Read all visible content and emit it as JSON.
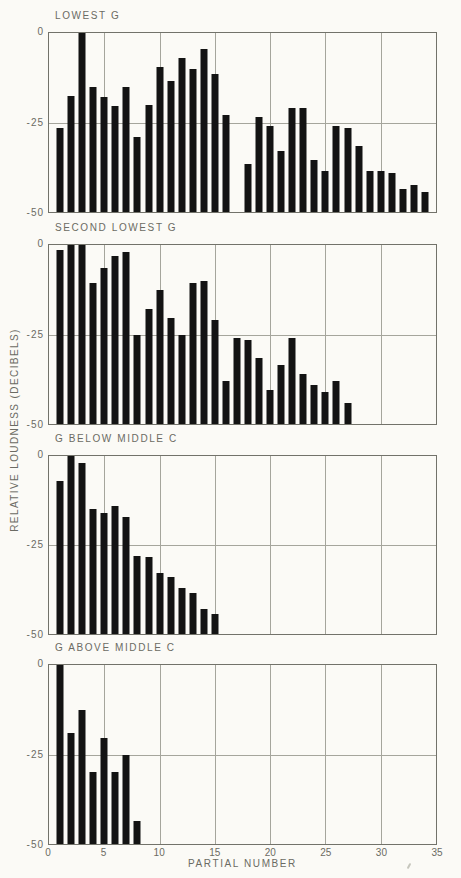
{
  "figure": {
    "x_tick_labels": [
      "0",
      "5",
      "10",
      "15",
      "20",
      "25",
      "30",
      "35"
    ],
    "y_tick_labels": [
      "0",
      "-25",
      "-50"
    ]
  },
  "chart_data": {
    "type": "bar",
    "xlabel": "PARTIAL NUMBER",
    "ylabel": "RELATIVE LOUDNESS (DECIBELS)",
    "xlim": [
      0,
      35
    ],
    "ylim": [
      -50,
      0
    ],
    "x_ticks": [
      0,
      5,
      10,
      15,
      20,
      25,
      30,
      35
    ],
    "y_ticks": [
      0,
      -25,
      -50
    ],
    "grid": "vertical lines every 5 partials; horizontal line at -25",
    "bar_color": "#131313",
    "panels": [
      {
        "title": "LOWEST G",
        "bars": [
          {
            "p": 1,
            "db": -26.5
          },
          {
            "p": 2,
            "db": -17.5
          },
          {
            "p": 3,
            "db": 0
          },
          {
            "p": 4,
            "db": -15
          },
          {
            "p": 5,
            "db": -18
          },
          {
            "p": 6,
            "db": -20.5
          },
          {
            "p": 7,
            "db": -15
          },
          {
            "p": 8,
            "db": -29
          },
          {
            "p": 9,
            "db": -20
          },
          {
            "p": 10,
            "db": -9.5
          },
          {
            "p": 11,
            "db": -13.5
          },
          {
            "p": 12,
            "db": -7
          },
          {
            "p": 13,
            "db": -10
          },
          {
            "p": 14,
            "db": -4.5
          },
          {
            "p": 15,
            "db": -11.5
          },
          {
            "p": 16,
            "db": -23
          },
          {
            "p": 18,
            "db": -36.5
          },
          {
            "p": 19,
            "db": -23.5
          },
          {
            "p": 20,
            "db": -26
          },
          {
            "p": 21,
            "db": -33
          },
          {
            "p": 22,
            "db": -21
          },
          {
            "p": 23,
            "db": -21
          },
          {
            "p": 24,
            "db": -35.5
          },
          {
            "p": 25,
            "db": -38.5
          },
          {
            "p": 26,
            "db": -26
          },
          {
            "p": 27,
            "db": -26.5
          },
          {
            "p": 28,
            "db": -31.5
          },
          {
            "p": 29,
            "db": -38.5
          },
          {
            "p": 30,
            "db": -38.5
          },
          {
            "p": 31,
            "db": -39
          },
          {
            "p": 32,
            "db": -43.5
          },
          {
            "p": 33,
            "db": -42.5
          },
          {
            "p": 34,
            "db": -44.5
          }
        ]
      },
      {
        "title": "SECOND LOWEST G",
        "bars": [
          {
            "p": 1,
            "db": -1.5
          },
          {
            "p": 2,
            "db": 0
          },
          {
            "p": 3,
            "db": 0
          },
          {
            "p": 4,
            "db": -10.5
          },
          {
            "p": 5,
            "db": -6.5
          },
          {
            "p": 6,
            "db": -3
          },
          {
            "p": 7,
            "db": -2
          },
          {
            "p": 8,
            "db": -25
          },
          {
            "p": 9,
            "db": -18
          },
          {
            "p": 10,
            "db": -12.5
          },
          {
            "p": 11,
            "db": -20.5
          },
          {
            "p": 12,
            "db": -25
          },
          {
            "p": 13,
            "db": -10.5
          },
          {
            "p": 14,
            "db": -10
          },
          {
            "p": 15,
            "db": -21
          },
          {
            "p": 16,
            "db": -38
          },
          {
            "p": 17,
            "db": -26
          },
          {
            "p": 18,
            "db": -26.5
          },
          {
            "p": 19,
            "db": -31.5
          },
          {
            "p": 20,
            "db": -40.5
          },
          {
            "p": 21,
            "db": -33.5
          },
          {
            "p": 22,
            "db": -26
          },
          {
            "p": 23,
            "db": -36
          },
          {
            "p": 24,
            "db": -39
          },
          {
            "p": 25,
            "db": -41
          },
          {
            "p": 26,
            "db": -38
          },
          {
            "p": 27,
            "db": -44
          }
        ]
      },
      {
        "title": "G BELOW MIDDLE C",
        "bars": [
          {
            "p": 1,
            "db": -7
          },
          {
            "p": 2,
            "db": 0
          },
          {
            "p": 3,
            "db": -2
          },
          {
            "p": 4,
            "db": -15
          },
          {
            "p": 5,
            "db": -16
          },
          {
            "p": 6,
            "db": -14
          },
          {
            "p": 7,
            "db": -17
          },
          {
            "p": 8,
            "db": -28
          },
          {
            "p": 9,
            "db": -28.5
          },
          {
            "p": 10,
            "db": -33
          },
          {
            "p": 11,
            "db": -34
          },
          {
            "p": 12,
            "db": -37
          },
          {
            "p": 13,
            "db": -38.5
          },
          {
            "p": 14,
            "db": -43
          },
          {
            "p": 15,
            "db": -44.5
          }
        ]
      },
      {
        "title": "G ABOVE MIDDLE C",
        "bars": [
          {
            "p": 1,
            "db": 0
          },
          {
            "p": 2,
            "db": -19
          },
          {
            "p": 3,
            "db": -12.5
          },
          {
            "p": 4,
            "db": -30
          },
          {
            "p": 5,
            "db": -20.5
          },
          {
            "p": 6,
            "db": -30
          },
          {
            "p": 7,
            "db": -25
          },
          {
            "p": 8,
            "db": -43.5
          }
        ]
      }
    ]
  }
}
